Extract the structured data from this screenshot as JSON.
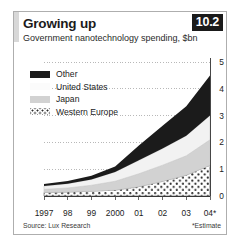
{
  "figure": {
    "number": "10.2",
    "title": "Growing up",
    "subtitle": "Government nanotechnology spending, $bn",
    "source": "Source: Lux Research",
    "estimate_note": "*Estimate"
  },
  "legend": {
    "items": [
      {
        "label": "Other",
        "swatch": "black-swatch",
        "color": "#1b1b1b"
      },
      {
        "label": "United States",
        "swatch": "white-swatch",
        "color": "#fbfbfb"
      },
      {
        "label": "Japan",
        "swatch": "grey-swatch",
        "color": "#d2d2d2"
      },
      {
        "label": "Western Europe",
        "swatch": "dotted-swatch",
        "color": "#ffffff"
      }
    ]
  },
  "chart_data": {
    "type": "area",
    "title": "Growing up",
    "subtitle": "Government nanotechnology spending, $bn",
    "xlabel": "",
    "ylabel": "$bn",
    "x": [
      1997,
      1998,
      1999,
      2000,
      2001,
      2002,
      2003,
      2004
    ],
    "categories": [
      "1997",
      "98",
      "99",
      "2000",
      "01",
      "02",
      "03",
      "04*"
    ],
    "xtick_labels": [
      "1997",
      "98",
      "99",
      "2000",
      "01",
      "02",
      "03",
      "04*"
    ],
    "ytick_labels": [
      "0",
      "1",
      "2",
      "3",
      "4",
      "5"
    ],
    "yticks": [
      0,
      1,
      2,
      3,
      4,
      5
    ],
    "ylim": [
      0,
      5
    ],
    "grid": true,
    "grid_style": "dotted",
    "legend_position": "upper-left",
    "stacked": true,
    "stack_order_bottom_to_top": [
      "Western Europe",
      "Japan",
      "United States",
      "Other"
    ],
    "series": [
      {
        "name": "Western Europe",
        "fill": "dotted",
        "color": "#ffffff",
        "values": [
          0.13,
          0.15,
          0.18,
          0.22,
          0.35,
          0.55,
          0.78,
          1.15
        ]
      },
      {
        "name": "Japan",
        "fill": "solid",
        "color": "#d2d2d2",
        "values": [
          0.12,
          0.15,
          0.22,
          0.33,
          0.48,
          0.6,
          0.72,
          0.95
        ]
      },
      {
        "name": "United States",
        "fill": "solid",
        "color": "#f2f2f2",
        "values": [
          0.12,
          0.16,
          0.22,
          0.35,
          0.5,
          0.62,
          0.75,
          0.9
        ]
      },
      {
        "name": "Other",
        "fill": "solid",
        "color": "#1b1b1b",
        "values": [
          0.08,
          0.1,
          0.14,
          0.2,
          0.55,
          0.85,
          1.1,
          1.5
        ]
      }
    ],
    "totals": [
      0.45,
      0.56,
      0.76,
      1.1,
      1.88,
      2.62,
      3.35,
      4.5
    ]
  }
}
